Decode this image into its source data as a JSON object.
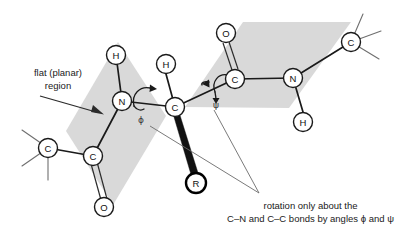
{
  "figure": {
    "background_color": "#ffffff",
    "plane_fill": "#d9d9d9",
    "bond_color": "#1a1a1a",
    "leader_color": "#6b6b6b"
  },
  "annotations": {
    "flat_region_line1": "flat (planar)",
    "flat_region_line2": "region",
    "caption_line1": "rotation only about the",
    "caption_line2": "C–N and C–C bonds by angles ϕ and ψ",
    "phi_symbol": "ϕ",
    "psi_symbol": "ψ"
  },
  "atoms": [
    {
      "id": "c-methyl-left",
      "label": "C",
      "x": 48,
      "y": 148,
      "style": "normal"
    },
    {
      "id": "c-carbonyl-left",
      "label": "C",
      "x": 93,
      "y": 156,
      "style": "normal"
    },
    {
      "id": "o-carbonyl-left",
      "label": "O",
      "x": 104,
      "y": 207,
      "style": "normal"
    },
    {
      "id": "n-amide-left",
      "label": "N",
      "x": 122,
      "y": 101,
      "style": "normal"
    },
    {
      "id": "h-amide-left",
      "label": "H",
      "x": 116,
      "y": 55,
      "style": "normal"
    },
    {
      "id": "c-alpha",
      "label": "C",
      "x": 175,
      "y": 107,
      "style": "normal"
    },
    {
      "id": "h-alpha",
      "label": "H",
      "x": 166,
      "y": 64,
      "style": "normal"
    },
    {
      "id": "r-group",
      "label": "R",
      "x": 196,
      "y": 183,
      "style": "bold"
    },
    {
      "id": "c-carbonyl-right",
      "label": "C",
      "x": 235,
      "y": 79,
      "style": "normal"
    },
    {
      "id": "o-carbonyl-right",
      "label": "O",
      "x": 226,
      "y": 33,
      "style": "normal"
    },
    {
      "id": "n-amide-right",
      "label": "N",
      "x": 293,
      "y": 78,
      "style": "normal"
    },
    {
      "id": "h-amide-right",
      "label": "H",
      "x": 303,
      "y": 122,
      "style": "normal"
    },
    {
      "id": "c-methyl-right",
      "label": "C",
      "x": 351,
      "y": 42,
      "style": "normal"
    }
  ],
  "planes": [
    {
      "id": "peptide-plane-left",
      "points": "66,131 118,42 166,116 113,205"
    },
    {
      "id": "peptide-plane-right",
      "points": "185,107 243,22 351,22 289,108"
    }
  ],
  "labels": {
    "carbon": "C",
    "nitrogen": "N",
    "oxygen": "O",
    "hydrogen": "H",
    "sidechain": "R"
  }
}
